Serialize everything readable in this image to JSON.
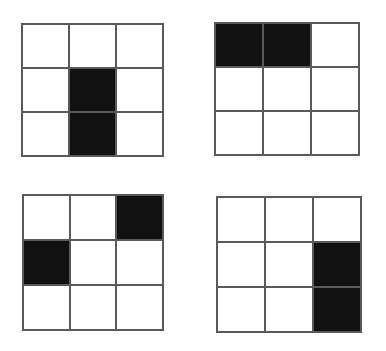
{
  "figure": {
    "background_color": "#ffffff",
    "line_color": "#5a5a5a",
    "fill_color": "#111111",
    "empty_color": "#ffffff",
    "rows": 3,
    "columns": 3,
    "panel_count": 4,
    "panels": [
      {
        "id": "panel-top-left",
        "position": "top-left",
        "x": 21,
        "y": 23,
        "width": 143,
        "height": 134,
        "filled_cells": [
          4,
          7
        ],
        "cells": [
          {
            "index": 0,
            "row": 1,
            "col": 1,
            "state": "empty"
          },
          {
            "index": 1,
            "row": 1,
            "col": 2,
            "state": "empty"
          },
          {
            "index": 2,
            "row": 1,
            "col": 3,
            "state": "empty"
          },
          {
            "index": 3,
            "row": 2,
            "col": 1,
            "state": "empty"
          },
          {
            "index": 4,
            "row": 2,
            "col": 2,
            "state": "filled"
          },
          {
            "index": 5,
            "row": 2,
            "col": 3,
            "state": "empty"
          },
          {
            "index": 6,
            "row": 3,
            "col": 1,
            "state": "empty"
          },
          {
            "index": 7,
            "row": 3,
            "col": 2,
            "state": "filled"
          },
          {
            "index": 8,
            "row": 3,
            "col": 3,
            "state": "empty"
          }
        ]
      },
      {
        "id": "panel-top-right",
        "position": "top-right",
        "x": 214,
        "y": 22,
        "width": 146,
        "height": 134,
        "filled_cells": [
          0,
          1
        ],
        "cells": [
          {
            "index": 0,
            "row": 1,
            "col": 1,
            "state": "filled"
          },
          {
            "index": 1,
            "row": 1,
            "col": 2,
            "state": "filled"
          },
          {
            "index": 2,
            "row": 1,
            "col": 3,
            "state": "empty"
          },
          {
            "index": 3,
            "row": 2,
            "col": 1,
            "state": "empty"
          },
          {
            "index": 4,
            "row": 2,
            "col": 2,
            "state": "empty"
          },
          {
            "index": 5,
            "row": 2,
            "col": 3,
            "state": "empty"
          },
          {
            "index": 6,
            "row": 3,
            "col": 1,
            "state": "empty"
          },
          {
            "index": 7,
            "row": 3,
            "col": 2,
            "state": "empty"
          },
          {
            "index": 8,
            "row": 3,
            "col": 3,
            "state": "empty"
          }
        ]
      },
      {
        "id": "panel-bottom-left",
        "position": "bottom-left",
        "x": 22,
        "y": 194,
        "width": 142,
        "height": 137,
        "filled_cells": [
          2,
          3
        ],
        "cells": [
          {
            "index": 0,
            "row": 1,
            "col": 1,
            "state": "empty"
          },
          {
            "index": 1,
            "row": 1,
            "col": 2,
            "state": "empty"
          },
          {
            "index": 2,
            "row": 1,
            "col": 3,
            "state": "filled"
          },
          {
            "index": 3,
            "row": 2,
            "col": 1,
            "state": "filled"
          },
          {
            "index": 4,
            "row": 2,
            "col": 2,
            "state": "empty"
          },
          {
            "index": 5,
            "row": 2,
            "col": 3,
            "state": "empty"
          },
          {
            "index": 6,
            "row": 3,
            "col": 1,
            "state": "empty"
          },
          {
            "index": 7,
            "row": 3,
            "col": 2,
            "state": "empty"
          },
          {
            "index": 8,
            "row": 3,
            "col": 3,
            "state": "empty"
          }
        ]
      },
      {
        "id": "panel-bottom-right",
        "position": "bottom-right",
        "x": 216,
        "y": 196,
        "width": 146,
        "height": 137,
        "filled_cells": [
          5,
          8
        ],
        "cells": [
          {
            "index": 0,
            "row": 1,
            "col": 1,
            "state": "empty"
          },
          {
            "index": 1,
            "row": 1,
            "col": 2,
            "state": "empty"
          },
          {
            "index": 2,
            "row": 1,
            "col": 3,
            "state": "empty"
          },
          {
            "index": 3,
            "row": 2,
            "col": 1,
            "state": "empty"
          },
          {
            "index": 4,
            "row": 2,
            "col": 2,
            "state": "empty"
          },
          {
            "index": 5,
            "row": 2,
            "col": 3,
            "state": "filled"
          },
          {
            "index": 6,
            "row": 3,
            "col": 1,
            "state": "empty"
          },
          {
            "index": 7,
            "row": 3,
            "col": 2,
            "state": "empty"
          },
          {
            "index": 8,
            "row": 3,
            "col": 3,
            "state": "filled"
          }
        ]
      }
    ]
  }
}
